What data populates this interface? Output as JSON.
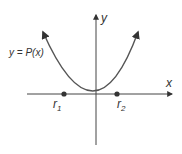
{
  "diagram": {
    "type": "parabola-graph",
    "function_label": "y = P(x)",
    "x_axis_label": "x",
    "y_axis_label": "y",
    "roots": [
      {
        "name": "r",
        "sub": "1"
      },
      {
        "name": "r",
        "sub": "2"
      }
    ],
    "colors": {
      "curve": "#555555",
      "axes": "#444444",
      "points": "#333333"
    }
  }
}
